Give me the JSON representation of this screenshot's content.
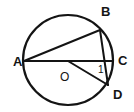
{
  "figure": {
    "background_color": "#ffffff",
    "stroke_color": "#141414",
    "width": 134,
    "height": 112
  },
  "circle": {
    "name": "circumscribed-circle",
    "center_x": 68,
    "center_y": 60,
    "radius": 45,
    "stroke_width": 2.2
  },
  "points": [
    {
      "id": "A",
      "label": "A",
      "x": 24,
      "y": 61,
      "label_x": 13,
      "label_y": 66,
      "font_size": 13
    },
    {
      "id": "B",
      "label": "B",
      "x": 100,
      "y": 30,
      "label_x": 101,
      "label_y": 16,
      "font_size": 13
    },
    {
      "id": "C",
      "label": "C",
      "x": 113,
      "y": 61,
      "label_x": 118,
      "label_y": 65,
      "font_size": 13
    },
    {
      "id": "D",
      "label": "D",
      "x": 108,
      "y": 85,
      "label_x": 113,
      "label_y": 99,
      "font_size": 13
    },
    {
      "id": "O",
      "label": "O",
      "x": 68,
      "y": 61,
      "label_x": 60,
      "label_y": 81,
      "font_size": 12
    }
  ],
  "segments": [
    {
      "id": "AC",
      "name": "diameter-a-to-c",
      "x1": 24,
      "y1": 61,
      "x2": 113,
      "y2": 61,
      "stroke_width": 2.0
    },
    {
      "id": "AB",
      "name": "chord-a-to-b",
      "x1": 24,
      "y1": 61,
      "x2": 100,
      "y2": 30,
      "stroke_width": 2.0
    },
    {
      "id": "BD",
      "name": "chord-b-to-d",
      "x1": 100,
      "y1": 30,
      "x2": 108,
      "y2": 85,
      "stroke_width": 2.0
    },
    {
      "id": "OD",
      "name": "radius-o-to-d",
      "x1": 68,
      "y1": 61,
      "x2": 108,
      "y2": 85,
      "stroke_width": 2.0
    }
  ],
  "angle_markers": [
    {
      "id": "1",
      "label": "1",
      "label_x": 98,
      "label_y": 73,
      "font_size": 10
    }
  ]
}
